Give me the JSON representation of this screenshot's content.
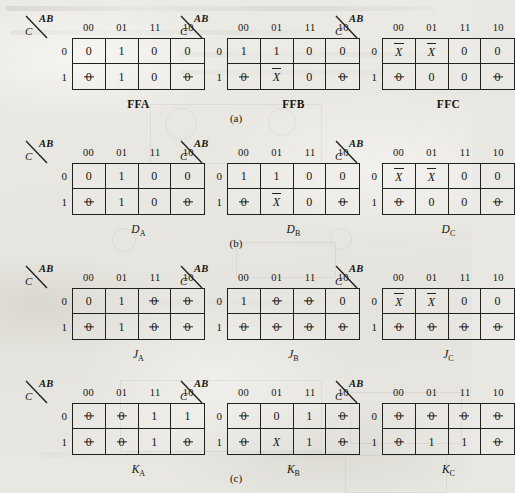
{
  "figure": {
    "page_background": "#e9e7e2",
    "ink_color": "#23211c",
    "column_header_title": "AB",
    "row_header_title": "C",
    "column_headers": [
      "00",
      "01",
      "11",
      "10"
    ],
    "row_headers": [
      "0",
      "1"
    ],
    "group_captions": [
      "(a)",
      "(b)",
      "(c)"
    ],
    "maps": [
      {
        "id": "ffa",
        "label": "FFA",
        "label_style": "bold",
        "label_base": "FFA",
        "label_sub": "",
        "group": "a",
        "rows": [
          [
            {
              "text": "0",
              "style": "plain"
            },
            {
              "text": "1",
              "style": "plain"
            },
            {
              "text": "0",
              "style": "plain"
            },
            {
              "text": "0",
              "style": "plain"
            }
          ],
          [
            {
              "text": "0",
              "style": "slashzero"
            },
            {
              "text": "1",
              "style": "plain"
            },
            {
              "text": "0",
              "style": "plain"
            },
            {
              "text": "0",
              "style": "slashzero"
            }
          ]
        ]
      },
      {
        "id": "ffb",
        "label": "FFB",
        "label_style": "bold",
        "label_base": "FFB",
        "label_sub": "",
        "group": "a",
        "rows": [
          [
            {
              "text": "1",
              "style": "plain"
            },
            {
              "text": "1",
              "style": "plain"
            },
            {
              "text": "0",
              "style": "plain"
            },
            {
              "text": "0",
              "style": "plain"
            }
          ],
          [
            {
              "text": "0",
              "style": "slashzero"
            },
            {
              "text": "X",
              "style": "overbar"
            },
            {
              "text": "0",
              "style": "plain"
            },
            {
              "text": "0",
              "style": "slashzero"
            }
          ]
        ]
      },
      {
        "id": "ffc",
        "label": "FFC",
        "label_style": "bold",
        "label_base": "FFC",
        "label_sub": "",
        "group": "a",
        "rows": [
          [
            {
              "text": "X",
              "style": "overbar"
            },
            {
              "text": "X",
              "style": "overbar"
            },
            {
              "text": "0",
              "style": "plain"
            },
            {
              "text": "0",
              "style": "plain"
            }
          ],
          [
            {
              "text": "0",
              "style": "slashzero"
            },
            {
              "text": "0",
              "style": "plain"
            },
            {
              "text": "0",
              "style": "plain"
            },
            {
              "text": "0",
              "style": "slashzero"
            }
          ]
        ]
      },
      {
        "id": "da",
        "label": "DA",
        "label_style": "italic-sub",
        "label_base": "D",
        "label_sub": "A",
        "group": "b",
        "rows": [
          [
            {
              "text": "0",
              "style": "plain"
            },
            {
              "text": "1",
              "style": "plain"
            },
            {
              "text": "0",
              "style": "plain"
            },
            {
              "text": "0",
              "style": "plain"
            }
          ],
          [
            {
              "text": "0",
              "style": "slashzero"
            },
            {
              "text": "1",
              "style": "plain"
            },
            {
              "text": "0",
              "style": "plain"
            },
            {
              "text": "0",
              "style": "slashzero"
            }
          ]
        ]
      },
      {
        "id": "db",
        "label": "DB",
        "label_style": "italic-sub",
        "label_base": "D",
        "label_sub": "B",
        "group": "b",
        "rows": [
          [
            {
              "text": "1",
              "style": "plain"
            },
            {
              "text": "1",
              "style": "plain"
            },
            {
              "text": "0",
              "style": "plain"
            },
            {
              "text": "0",
              "style": "plain"
            }
          ],
          [
            {
              "text": "0",
              "style": "slashzero"
            },
            {
              "text": "X",
              "style": "overbar"
            },
            {
              "text": "0",
              "style": "plain"
            },
            {
              "text": "0",
              "style": "slashzero"
            }
          ]
        ]
      },
      {
        "id": "dc",
        "label": "DC",
        "label_style": "italic-sub",
        "label_base": "D",
        "label_sub": "C",
        "group": "b",
        "rows": [
          [
            {
              "text": "X",
              "style": "overbar"
            },
            {
              "text": "X",
              "style": "overbar"
            },
            {
              "text": "0",
              "style": "plain"
            },
            {
              "text": "0",
              "style": "plain"
            }
          ],
          [
            {
              "text": "0",
              "style": "slashzero"
            },
            {
              "text": "0",
              "style": "plain"
            },
            {
              "text": "0",
              "style": "plain"
            },
            {
              "text": "0",
              "style": "slashzero"
            }
          ]
        ]
      },
      {
        "id": "ja",
        "label": "JA",
        "label_style": "italic-sub",
        "label_base": "J",
        "label_sub": "A",
        "group": "c",
        "rows": [
          [
            {
              "text": "0",
              "style": "plain"
            },
            {
              "text": "1",
              "style": "plain"
            },
            {
              "text": "0",
              "style": "slashzero"
            },
            {
              "text": "0",
              "style": "slashzero"
            }
          ],
          [
            {
              "text": "0",
              "style": "slashzero"
            },
            {
              "text": "1",
              "style": "plain"
            },
            {
              "text": "0",
              "style": "slashzero"
            },
            {
              "text": "0",
              "style": "slashzero"
            }
          ]
        ]
      },
      {
        "id": "jb",
        "label": "JB",
        "label_style": "italic-sub",
        "label_base": "J",
        "label_sub": "B",
        "group": "c",
        "rows": [
          [
            {
              "text": "1",
              "style": "plain"
            },
            {
              "text": "0",
              "style": "slashzero"
            },
            {
              "text": "0",
              "style": "slashzero"
            },
            {
              "text": "0",
              "style": "plain"
            }
          ],
          [
            {
              "text": "0",
              "style": "slashzero"
            },
            {
              "text": "0",
              "style": "slashzero"
            },
            {
              "text": "0",
              "style": "slashzero"
            },
            {
              "text": "0",
              "style": "slashzero"
            }
          ]
        ]
      },
      {
        "id": "jc",
        "label": "JC",
        "label_style": "italic-sub",
        "label_base": "J",
        "label_sub": "C",
        "group": "c",
        "rows": [
          [
            {
              "text": "X",
              "style": "overbar"
            },
            {
              "text": "X",
              "style": "overbar"
            },
            {
              "text": "0",
              "style": "plain"
            },
            {
              "text": "0",
              "style": "plain"
            }
          ],
          [
            {
              "text": "0",
              "style": "slashzero"
            },
            {
              "text": "0",
              "style": "slashzero"
            },
            {
              "text": "0",
              "style": "slashzero"
            },
            {
              "text": "0",
              "style": "slashzero"
            }
          ]
        ]
      },
      {
        "id": "ka",
        "label": "KA",
        "label_style": "italic-sub",
        "label_base": "K",
        "label_sub": "A",
        "group": "d",
        "rows": [
          [
            {
              "text": "0",
              "style": "slashzero"
            },
            {
              "text": "0",
              "style": "slashzero"
            },
            {
              "text": "1",
              "style": "plain"
            },
            {
              "text": "1",
              "style": "plain"
            }
          ],
          [
            {
              "text": "0",
              "style": "slashzero"
            },
            {
              "text": "0",
              "style": "slashzero"
            },
            {
              "text": "1",
              "style": "plain"
            },
            {
              "text": "0",
              "style": "slashzero"
            }
          ]
        ]
      },
      {
        "id": "kb",
        "label": "KB",
        "label_style": "italic-sub",
        "label_base": "K",
        "label_sub": "B",
        "group": "d",
        "rows": [
          [
            {
              "text": "0",
              "style": "slashzero"
            },
            {
              "text": "0",
              "style": "plain"
            },
            {
              "text": "1",
              "style": "plain"
            },
            {
              "text": "0",
              "style": "slashzero"
            }
          ],
          [
            {
              "text": "0",
              "style": "slashzero"
            },
            {
              "text": "X",
              "style": "italic"
            },
            {
              "text": "1",
              "style": "plain"
            },
            {
              "text": "0",
              "style": "slashzero"
            }
          ]
        ]
      },
      {
        "id": "kc",
        "label": "KC",
        "label_style": "italic-sub",
        "label_base": "K",
        "label_sub": "C",
        "group": "d",
        "rows": [
          [
            {
              "text": "0",
              "style": "slashzero"
            },
            {
              "text": "0",
              "style": "slashzero"
            },
            {
              "text": "0",
              "style": "slashzero"
            },
            {
              "text": "0",
              "style": "slashzero"
            }
          ],
          [
            {
              "text": "0",
              "style": "slashzero"
            },
            {
              "text": "1",
              "style": "plain"
            },
            {
              "text": "1",
              "style": "plain"
            },
            {
              "text": "0",
              "style": "slashzero"
            }
          ]
        ]
      }
    ]
  }
}
